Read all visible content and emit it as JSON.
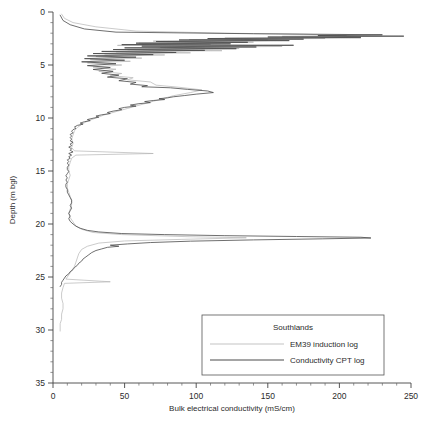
{
  "chart_data": {
    "type": "line",
    "title": "",
    "xlabel": "Bulk electrical conductivity (mS/cm)",
    "ylabel": "Depth (m bgl)",
    "xlim": [
      0,
      250
    ],
    "ylim": [
      0,
      35
    ],
    "y_inverted": true,
    "grid": false,
    "x_ticks": [
      0,
      50,
      100,
      150,
      200,
      250
    ],
    "x_tick_labels": [
      "0",
      "50",
      "100",
      "150",
      "200",
      "250"
    ],
    "x_minor_interval": 10,
    "y_ticks": [
      0,
      5,
      10,
      15,
      20,
      25,
      30,
      35
    ],
    "y_tick_labels": [
      "0",
      "5",
      "10",
      "15",
      "20",
      "25",
      "30",
      "35"
    ],
    "y_minor_interval": 1,
    "legend": {
      "position": "lower-center",
      "title": "Southlands",
      "entries": [
        {
          "name": "EM39 induction log",
          "color": "#b4b4b4"
        },
        {
          "name": "Conductivity CPT log",
          "color": "#4a4a4a"
        }
      ]
    },
    "series": [
      {
        "name": "EM39 induction log",
        "color": "#b4b4b4",
        "x_label": "conductivity_mScm",
        "y_label": "depth_m",
        "points": [
          [
            6,
            0.2
          ],
          [
            8,
            0.6
          ],
          [
            14,
            1.0
          ],
          [
            30,
            1.4
          ],
          [
            58,
            1.8
          ],
          [
            120,
            2.0
          ],
          [
            175,
            2.1
          ],
          [
            205,
            2.2
          ],
          [
            160,
            2.3
          ],
          [
            215,
            2.35
          ],
          [
            120,
            2.45
          ],
          [
            190,
            2.5
          ],
          [
            95,
            2.6
          ],
          [
            150,
            2.65
          ],
          [
            70,
            2.75
          ],
          [
            140,
            2.85
          ],
          [
            60,
            2.95
          ],
          [
            110,
            3.05
          ],
          [
            45,
            3.15
          ],
          [
            160,
            3.25
          ],
          [
            75,
            3.35
          ],
          [
            130,
            3.45
          ],
          [
            52,
            3.55
          ],
          [
            118,
            3.65
          ],
          [
            44,
            3.75
          ],
          [
            96,
            3.85
          ],
          [
            36,
            3.95
          ],
          [
            78,
            4.05
          ],
          [
            30,
            4.2
          ],
          [
            62,
            4.35
          ],
          [
            26,
            4.5
          ],
          [
            54,
            4.65
          ],
          [
            24,
            4.8
          ],
          [
            48,
            5.0
          ],
          [
            28,
            5.2
          ],
          [
            44,
            5.4
          ],
          [
            32,
            5.6
          ],
          [
            48,
            5.8
          ],
          [
            40,
            6.0
          ],
          [
            56,
            6.2
          ],
          [
            52,
            6.4
          ],
          [
            68,
            6.6
          ],
          [
            72,
            6.9
          ],
          [
            88,
            7.1
          ],
          [
            104,
            7.35
          ],
          [
            96,
            7.6
          ],
          [
            84,
            7.9
          ],
          [
            76,
            8.2
          ],
          [
            68,
            8.5
          ],
          [
            60,
            8.8
          ],
          [
            52,
            9.1
          ],
          [
            44,
            9.4
          ],
          [
            36,
            9.7
          ],
          [
            30,
            10.0
          ],
          [
            24,
            10.3
          ],
          [
            20,
            10.6
          ],
          [
            17,
            10.9
          ],
          [
            15,
            11.2
          ],
          [
            14,
            11.6
          ],
          [
            13,
            12.0
          ],
          [
            14,
            12.4
          ],
          [
            13,
            12.8
          ],
          [
            15,
            13.1
          ],
          [
            70,
            13.35
          ],
          [
            16,
            13.5
          ],
          [
            13,
            13.8
          ],
          [
            12,
            14.2
          ],
          [
            11,
            14.6
          ],
          [
            11,
            15.0
          ],
          [
            12,
            15.4
          ],
          [
            11,
            15.8
          ],
          [
            10,
            16.2
          ],
          [
            10,
            16.6
          ],
          [
            11,
            17.0
          ],
          [
            12,
            17.4
          ],
          [
            13,
            17.8
          ],
          [
            13,
            18.2
          ],
          [
            12,
            18.6
          ],
          [
            11,
            19.0
          ],
          [
            12,
            19.4
          ],
          [
            14,
            19.8
          ],
          [
            16,
            20.2
          ],
          [
            20,
            20.5
          ],
          [
            28,
            20.8
          ],
          [
            48,
            21.0
          ],
          [
            95,
            21.2
          ],
          [
            135,
            21.3
          ],
          [
            90,
            21.45
          ],
          [
            50,
            21.6
          ],
          [
            32,
            21.8
          ],
          [
            24,
            22.1
          ],
          [
            20,
            22.4
          ],
          [
            18,
            22.8
          ],
          [
            17,
            23.2
          ],
          [
            16,
            23.6
          ],
          [
            15,
            24.0
          ],
          [
            13,
            24.4
          ],
          [
            11,
            24.8
          ],
          [
            9,
            25.2
          ],
          [
            40,
            25.45
          ],
          [
            8,
            25.6
          ],
          [
            7,
            26.0
          ],
          [
            6,
            26.5
          ],
          [
            6,
            27.0
          ],
          [
            7,
            27.5
          ],
          [
            7,
            28.0
          ],
          [
            6,
            28.5
          ],
          [
            6,
            29.0
          ],
          [
            5,
            29.4
          ],
          [
            5,
            29.8
          ],
          [
            5,
            30.1
          ]
        ]
      },
      {
        "name": "Conductivity CPT log",
        "color": "#4a4a4a",
        "x_label": "conductivity_mScm",
        "y_label": "depth_m",
        "points": [
          [
            5,
            0.3
          ],
          [
            7,
            0.8
          ],
          [
            12,
            1.2
          ],
          [
            22,
            1.6
          ],
          [
            44,
            1.9
          ],
          [
            140,
            2.05
          ],
          [
            230,
            2.15
          ],
          [
            185,
            2.22
          ],
          [
            245,
            2.28
          ],
          [
            150,
            2.36
          ],
          [
            215,
            2.42
          ],
          [
            108,
            2.5
          ],
          [
            175,
            2.56
          ],
          [
            88,
            2.64
          ],
          [
            165,
            2.7
          ],
          [
            72,
            2.78
          ],
          [
            136,
            2.86
          ],
          [
            58,
            2.94
          ],
          [
            124,
            3.0
          ],
          [
            48,
            3.08
          ],
          [
            168,
            3.14
          ],
          [
            62,
            3.22
          ],
          [
            142,
            3.3
          ],
          [
            50,
            3.38
          ],
          [
            128,
            3.46
          ],
          [
            42,
            3.54
          ],
          [
            106,
            3.62
          ],
          [
            34,
            3.72
          ],
          [
            86,
            3.82
          ],
          [
            28,
            3.92
          ],
          [
            70,
            4.02
          ],
          [
            24,
            4.14
          ],
          [
            58,
            4.26
          ],
          [
            22,
            4.4
          ],
          [
            50,
            4.55
          ],
          [
            20,
            4.7
          ],
          [
            44,
            4.88
          ],
          [
            24,
            5.06
          ],
          [
            40,
            5.24
          ],
          [
            28,
            5.42
          ],
          [
            42,
            5.6
          ],
          [
            34,
            5.78
          ],
          [
            46,
            5.96
          ],
          [
            38,
            6.14
          ],
          [
            52,
            6.3
          ],
          [
            46,
            6.48
          ],
          [
            58,
            6.64
          ],
          [
            54,
            6.8
          ],
          [
            66,
            6.95
          ],
          [
            62,
            7.05
          ],
          [
            82,
            7.15
          ],
          [
            94,
            7.3
          ],
          [
            108,
            7.45
          ],
          [
            112,
            7.6
          ],
          [
            100,
            7.75
          ],
          [
            92,
            7.88
          ],
          [
            84,
            8.0
          ],
          [
            80,
            8.1
          ],
          [
            74,
            8.18
          ],
          [
            78,
            8.26
          ],
          [
            70,
            8.35
          ],
          [
            64,
            8.45
          ],
          [
            68,
            8.55
          ],
          [
            60,
            8.65
          ],
          [
            54,
            8.78
          ],
          [
            58,
            8.88
          ],
          [
            50,
            9.0
          ],
          [
            46,
            9.12
          ],
          [
            48,
            9.22
          ],
          [
            42,
            9.35
          ],
          [
            38,
            9.48
          ],
          [
            40,
            9.58
          ],
          [
            34,
            9.7
          ],
          [
            30,
            9.82
          ],
          [
            32,
            9.92
          ],
          [
            28,
            10.02
          ],
          [
            24,
            10.15
          ],
          [
            26,
            10.25
          ],
          [
            22,
            10.35
          ],
          [
            19,
            10.48
          ],
          [
            21,
            10.58
          ],
          [
            17,
            10.7
          ],
          [
            15,
            10.85
          ],
          [
            16,
            10.98
          ],
          [
            14,
            11.1
          ],
          [
            13,
            11.25
          ],
          [
            14,
            11.4
          ],
          [
            12,
            11.55
          ],
          [
            13,
            11.7
          ],
          [
            12,
            11.85
          ],
          [
            13,
            12.0
          ],
          [
            12,
            12.15
          ],
          [
            14,
            12.3
          ],
          [
            12,
            12.45
          ],
          [
            13,
            12.6
          ],
          [
            11,
            12.75
          ],
          [
            13,
            12.9
          ],
          [
            12,
            13.05
          ],
          [
            14,
            13.2
          ],
          [
            11,
            13.35
          ],
          [
            13,
            13.5
          ],
          [
            11,
            13.65
          ],
          [
            12,
            13.8
          ],
          [
            10,
            13.95
          ],
          [
            11,
            14.1
          ],
          [
            10,
            14.25
          ],
          [
            11,
            14.45
          ],
          [
            10,
            14.65
          ],
          [
            10,
            14.85
          ],
          [
            11,
            15.05
          ],
          [
            10,
            15.25
          ],
          [
            9,
            15.45
          ],
          [
            10,
            15.65
          ],
          [
            9,
            15.85
          ],
          [
            10,
            16.05
          ],
          [
            9,
            16.25
          ],
          [
            9,
            16.5
          ],
          [
            10,
            16.75
          ],
          [
            10,
            17.0
          ],
          [
            11,
            17.25
          ],
          [
            12,
            17.5
          ],
          [
            13,
            17.75
          ],
          [
            13,
            18.0
          ],
          [
            12,
            18.25
          ],
          [
            13,
            18.5
          ],
          [
            12,
            18.75
          ],
          [
            11,
            19.0
          ],
          [
            12,
            19.25
          ],
          [
            11,
            19.5
          ],
          [
            12,
            19.75
          ],
          [
            14,
            20.0
          ],
          [
            16,
            20.2
          ],
          [
            19,
            20.4
          ],
          [
            24,
            20.6
          ],
          [
            32,
            20.75
          ],
          [
            48,
            20.9
          ],
          [
            78,
            21.0
          ],
          [
            120,
            21.1
          ],
          [
            170,
            21.18
          ],
          [
            215,
            21.25
          ],
          [
            222,
            21.32
          ],
          [
            188,
            21.4
          ],
          [
            140,
            21.5
          ],
          [
            96,
            21.62
          ],
          [
            68,
            21.75
          ],
          [
            52,
            21.88
          ],
          [
            40,
            22.0
          ],
          [
            46,
            22.1
          ],
          [
            38,
            22.2
          ],
          [
            34,
            22.35
          ],
          [
            30,
            22.5
          ],
          [
            27,
            22.7
          ],
          [
            25,
            22.9
          ],
          [
            23,
            23.1
          ],
          [
            21,
            23.3
          ],
          [
            20,
            23.5
          ],
          [
            18,
            23.7
          ],
          [
            17,
            23.9
          ],
          [
            15,
            24.1
          ],
          [
            14,
            24.3
          ],
          [
            12,
            24.5
          ],
          [
            11,
            24.7
          ],
          [
            9,
            24.9
          ],
          [
            8,
            25.1
          ],
          [
            7,
            25.3
          ],
          [
            6,
            25.5
          ],
          [
            6,
            25.7
          ],
          [
            5,
            25.9
          ]
        ]
      }
    ]
  },
  "axes": {
    "x_title": "Bulk electrical conductivity (mS/cm)",
    "y_title": "Depth (m bgl)"
  },
  "legend": {
    "title": "Southlands",
    "item_em39": "EM39 induction log",
    "item_cpt": "Conductivity CPT log"
  },
  "colors": {
    "em39": "#b4b4b4",
    "cpt": "#4a4a4a",
    "axis": "#444444",
    "background": "#ffffff"
  }
}
